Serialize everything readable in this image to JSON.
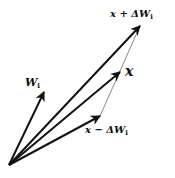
{
  "diagram": {
    "origin": {
      "x": 9,
      "y": 165
    },
    "vectors": [
      {
        "name": "W_i",
        "label": "W",
        "sub": "i",
        "tip": {
          "x": 44,
          "y": 92
        }
      },
      {
        "name": "x_plus_dW",
        "label": "x + ΔW",
        "sub": "i",
        "tip": {
          "x": 140,
          "y": 26
        }
      },
      {
        "name": "x",
        "label": "x",
        "sub": "",
        "tip": {
          "x": 120,
          "y": 72
        }
      },
      {
        "name": "x_minus_dW",
        "label": "x − ΔW",
        "sub": "i",
        "tip": {
          "x": 100,
          "y": 116
        }
      }
    ],
    "connector": {
      "from": {
        "x": 100,
        "y": 116
      },
      "to": {
        "x": 140,
        "y": 26
      }
    },
    "colors": {
      "stroke": "#111111",
      "connector": "#555555"
    }
  }
}
